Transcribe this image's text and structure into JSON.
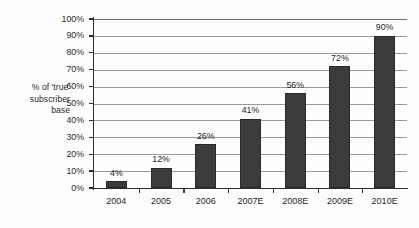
{
  "chart_data": {
    "type": "bar",
    "title": "",
    "subtitle": "",
    "xlabel": "",
    "ylabel": "% of 'true' subscriber base",
    "ylabel_lines": [
      "% of 'true'",
      "subscriber",
      "base"
    ],
    "categories": [
      "2004",
      "2005",
      "2006",
      "2007E",
      "2008E",
      "2009E",
      "2010E"
    ],
    "values": [
      4,
      12,
      26,
      41,
      56,
      72,
      90
    ],
    "value_labels": [
      "4%",
      "12%",
      "26%",
      "41%",
      "56%",
      "72%",
      "90%"
    ],
    "ylim": [
      0,
      100
    ],
    "ytick_values": [
      0,
      10,
      20,
      30,
      40,
      50,
      60,
      70,
      80,
      90,
      100
    ],
    "ytick_labels": [
      "0%",
      "10%",
      "20%",
      "30%",
      "40%",
      "50%",
      "60%",
      "70%",
      "80%",
      "90%",
      "100%"
    ],
    "grid": "horizontal",
    "legend": "none",
    "series": [
      {
        "name": "% of 'true' subscriber base",
        "values": [
          4,
          12,
          26,
          41,
          56,
          72,
          90
        ],
        "color": "#3b3b3b"
      }
    ],
    "colors": {
      "bar": "#3b3b3b",
      "bar_outline": "#2a2a2a",
      "gridline": "#9a9a9a",
      "axis": "#2e2e2e",
      "text": "#1f1f1f",
      "background": "#fdfdfd"
    }
  }
}
